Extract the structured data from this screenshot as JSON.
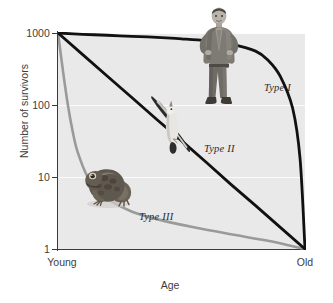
{
  "figure": {
    "kind": "survivorship-curve-figure"
  },
  "axes": {
    "y_title": "Number of survivors",
    "x_title": "Age",
    "y_ticks": [
      "1000",
      "100",
      "10",
      "1"
    ],
    "x_ticks": [
      "Young",
      "Old"
    ]
  },
  "curves": {
    "type1_label": "Type I",
    "type2_label": "Type II",
    "type3_label": "Type III"
  },
  "illustrations": {
    "human": "human-photo",
    "bird": "seagull-photo",
    "frog": "frog-photo"
  },
  "colors": {
    "plot_background": "#e9e9e9",
    "axis": "#3a3a3a",
    "type1_line": "#111111",
    "type2_line": "#111111",
    "type3_line": "#9a9a9a",
    "gridline": "#ffffff"
  },
  "chart_data": {
    "type": "line",
    "title": "",
    "subtitle": "",
    "xlabel": "Age",
    "ylabel": "Number of survivors",
    "yscale": "log",
    "ylim": [
      1,
      1000
    ],
    "ytick_labels": [
      "1000",
      "100",
      "10",
      "1"
    ],
    "ytick_values": [
      1000,
      100,
      10,
      1
    ],
    "xlim": [
      0,
      100
    ],
    "xtick_labels": [
      "Young",
      "Old"
    ],
    "xtick_values": [
      0,
      100
    ],
    "grid": true,
    "legend": "inline-annotations",
    "annotations": [
      {
        "text": "Type I",
        "x": 88,
        "y": 180,
        "style": "italic"
      },
      {
        "text": "Type II",
        "x": 62,
        "y": 22,
        "style": "italic"
      },
      {
        "text": "Type III",
        "x": 34,
        "y": 2.6,
        "style": "italic"
      }
    ],
    "series": [
      {
        "name": "Type I",
        "color": "#111111",
        "organism": "human",
        "shape": "convex",
        "x": [
          0,
          10,
          20,
          30,
          40,
          50,
          60,
          70,
          80,
          85,
          90,
          95,
          98,
          100
        ],
        "values": [
          1000,
          960,
          930,
          900,
          870,
          830,
          780,
          700,
          560,
          420,
          250,
          90,
          18,
          1
        ]
      },
      {
        "name": "Type II",
        "color": "#111111",
        "organism": "bird",
        "shape": "linear-on-log",
        "x": [
          0,
          10,
          20,
          30,
          40,
          50,
          60,
          70,
          80,
          90,
          100
        ],
        "values": [
          1000,
          501,
          251,
          126,
          63,
          32,
          16,
          7.9,
          4,
          2,
          1
        ]
      },
      {
        "name": "Type III",
        "color": "#9a9a9a",
        "organism": "frog",
        "shape": "concave",
        "x": [
          0,
          2,
          4,
          6,
          8,
          12,
          16,
          22,
          30,
          40,
          55,
          70,
          85,
          100
        ],
        "values": [
          1000,
          300,
          100,
          42,
          22,
          10,
          6.5,
          4.5,
          3.3,
          2.6,
          2.0,
          1.6,
          1.3,
          1
        ]
      }
    ]
  }
}
